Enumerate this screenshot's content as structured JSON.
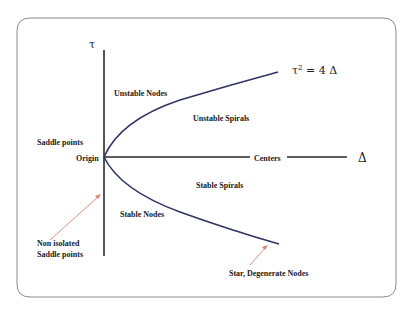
{
  "diagram": {
    "type": "stability-diagram",
    "axes": {
      "vertical_label": "τ",
      "horizontal_label": "Δ"
    },
    "curve_label": {
      "base": "τ",
      "exponent": "2",
      "rest": " = 4 Δ"
    },
    "regions": {
      "unstable_nodes": "Unstable Nodes",
      "unstable_spirals": "Unstable Spirals",
      "saddle_points": "Saddle points",
      "origin": "Origin",
      "centers": "Centers",
      "stable_spirals": "Stable Spirals",
      "stable_nodes": "Stable Nodes",
      "non_isolated_line1": "Non isolated",
      "non_isolated_line2": "Saddle points",
      "star_degenerate": "Star, Degenerate Nodes"
    },
    "colors": {
      "frame": "#8a8a8a",
      "axes": "#2a2a2a",
      "curve": "#2e3566",
      "arrow": "#d9826e",
      "text": "#1a1a1a"
    }
  }
}
